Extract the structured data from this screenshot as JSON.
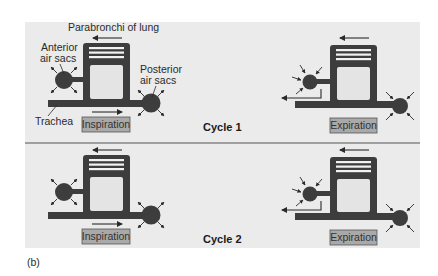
{
  "figure_label": "(b)",
  "colors": {
    "panel": "#ebebeb",
    "structure": "#3d3d3d",
    "inner": "#e4e4e4",
    "label_box": "#a9a9a9",
    "separator": "#555555"
  },
  "labels": {
    "parabronchi": "Parabronchi of lung",
    "anterior_1": "Anterior",
    "anterior_2": "air sacs",
    "posterior_1": "Posterior",
    "posterior_2": "air sacs",
    "trachea": "Trachea"
  },
  "cycles": [
    {
      "title": "Cycle 1",
      "inspiration": "Inspiration",
      "expiration": "Expiration"
    },
    {
      "title": "Cycle 2",
      "inspiration": "Inspiration",
      "expiration": "Expiration"
    }
  ]
}
